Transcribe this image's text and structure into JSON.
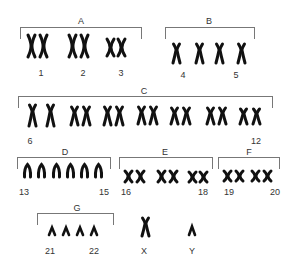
{
  "ink_color": "#111111",
  "bracket_color": "#777777",
  "label_color": "#333333",
  "groups": [
    {
      "name": "A",
      "label_x": 81,
      "label_y": 16,
      "bracket": {
        "x": 20,
        "y": 27,
        "w": 122,
        "h": 12
      },
      "chromosomes": [
        {
          "type": "meta",
          "x": 31,
          "y": 35,
          "h": 22
        },
        {
          "type": "meta",
          "x": 43,
          "y": 35,
          "h": 22
        },
        {
          "type": "meta",
          "x": 72,
          "y": 35,
          "h": 22
        },
        {
          "type": "meta",
          "x": 84,
          "y": 35,
          "h": 22
        },
        {
          "type": "meta-short",
          "x": 110,
          "y": 39,
          "h": 17
        },
        {
          "type": "meta-short",
          "x": 121,
          "y": 39,
          "h": 17
        }
      ],
      "numbers": [
        {
          "text": "1",
          "x": 41,
          "y": 68
        },
        {
          "text": "2",
          "x": 83,
          "y": 68
        },
        {
          "text": "3",
          "x": 121,
          "y": 68
        }
      ]
    },
    {
      "name": "B",
      "label_x": 209,
      "label_y": 16,
      "bracket": {
        "x": 165,
        "y": 27,
        "w": 90,
        "h": 12
      },
      "chromosomes": [
        {
          "type": "submeta",
          "x": 176,
          "y": 44,
          "h": 19
        },
        {
          "type": "submeta",
          "x": 199,
          "y": 44,
          "h": 19
        },
        {
          "type": "submeta",
          "x": 219,
          "y": 44,
          "h": 19
        },
        {
          "type": "submeta",
          "x": 241,
          "y": 44,
          "h": 19
        }
      ],
      "numbers": [
        {
          "text": "4",
          "x": 183,
          "y": 70
        },
        {
          "text": "5",
          "x": 236,
          "y": 70
        }
      ]
    },
    {
      "name": "C",
      "label_x": 144,
      "label_y": 86,
      "bracket": {
        "x": 18,
        "y": 96,
        "w": 255,
        "h": 12
      },
      "chromosomes": [
        {
          "type": "submeta",
          "x": 32,
          "y": 105,
          "h": 21
        },
        {
          "type": "submeta",
          "x": 50,
          "y": 105,
          "h": 21
        },
        {
          "type": "submeta",
          "x": 74,
          "y": 107,
          "h": 18
        },
        {
          "type": "submeta",
          "x": 86,
          "y": 107,
          "h": 18
        },
        {
          "type": "submeta",
          "x": 107,
          "y": 107,
          "h": 18
        },
        {
          "type": "submeta",
          "x": 119,
          "y": 107,
          "h": 18
        },
        {
          "type": "submeta",
          "x": 141,
          "y": 107,
          "h": 17
        },
        {
          "type": "submeta",
          "x": 153,
          "y": 107,
          "h": 17
        },
        {
          "type": "submeta",
          "x": 174,
          "y": 108,
          "h": 16
        },
        {
          "type": "submeta",
          "x": 186,
          "y": 108,
          "h": 16
        },
        {
          "type": "submeta",
          "x": 210,
          "y": 108,
          "h": 16
        },
        {
          "type": "submeta",
          "x": 222,
          "y": 108,
          "h": 16
        },
        {
          "type": "submeta",
          "x": 243,
          "y": 109,
          "h": 15
        },
        {
          "type": "submeta",
          "x": 256,
          "y": 109,
          "h": 15
        }
      ],
      "numbers": [
        {
          "text": "6",
          "x": 30,
          "y": 136
        },
        {
          "text": "12",
          "x": 256,
          "y": 136
        }
      ]
    },
    {
      "name": "D",
      "label_x": 65,
      "label_y": 147,
      "bracket": {
        "x": 17,
        "y": 157,
        "w": 94,
        "h": 12
      },
      "chromosomes": [
        {
          "type": "acro",
          "x": 27,
          "y": 164,
          "h": 13
        },
        {
          "type": "acro",
          "x": 41,
          "y": 164,
          "h": 13
        },
        {
          "type": "acro",
          "x": 56,
          "y": 164,
          "h": 13
        },
        {
          "type": "acro",
          "x": 70,
          "y": 164,
          "h": 13
        },
        {
          "type": "acro",
          "x": 84,
          "y": 164,
          "h": 13
        },
        {
          "type": "acro",
          "x": 98,
          "y": 164,
          "h": 13
        }
      ],
      "numbers": [
        {
          "text": "13",
          "x": 24,
          "y": 187
        },
        {
          "text": "15",
          "x": 104,
          "y": 187
        }
      ]
    },
    {
      "name": "E",
      "label_x": 165,
      "label_y": 147,
      "bracket": {
        "x": 119,
        "y": 157,
        "w": 94,
        "h": 12
      },
      "chromosomes": [
        {
          "type": "meta-small",
          "x": 128,
          "y": 171,
          "h": 11
        },
        {
          "type": "meta-small",
          "x": 140,
          "y": 171,
          "h": 11
        },
        {
          "type": "meta-small",
          "x": 161,
          "y": 171,
          "h": 11
        },
        {
          "type": "meta-small",
          "x": 173,
          "y": 171,
          "h": 11
        },
        {
          "type": "meta-small",
          "x": 192,
          "y": 172,
          "h": 10
        },
        {
          "type": "meta-small",
          "x": 203,
          "y": 172,
          "h": 10
        }
      ],
      "numbers": [
        {
          "text": "16",
          "x": 126,
          "y": 187
        },
        {
          "text": "18",
          "x": 203,
          "y": 187
        }
      ]
    },
    {
      "name": "F",
      "label_x": 249,
      "label_y": 147,
      "bracket": {
        "x": 218,
        "y": 157,
        "w": 62,
        "h": 12
      },
      "chromosomes": [
        {
          "type": "meta-small",
          "x": 227,
          "y": 171,
          "h": 10
        },
        {
          "type": "meta-small",
          "x": 239,
          "y": 171,
          "h": 10
        },
        {
          "type": "meta-small",
          "x": 255,
          "y": 171,
          "h": 10
        },
        {
          "type": "meta-small",
          "x": 267,
          "y": 171,
          "h": 10
        }
      ],
      "numbers": [
        {
          "text": "19",
          "x": 229,
          "y": 187
        },
        {
          "text": "20",
          "x": 275,
          "y": 187
        }
      ]
    },
    {
      "name": "G",
      "label_x": 77,
      "label_y": 203,
      "bracket": {
        "x": 37,
        "y": 213,
        "w": 77,
        "h": 12
      },
      "chromosomes": [
        {
          "type": "acro-small",
          "x": 52,
          "y": 227,
          "h": 8
        },
        {
          "type": "acro-small",
          "x": 66,
          "y": 227,
          "h": 8
        },
        {
          "type": "acro-small",
          "x": 80,
          "y": 227,
          "h": 8
        },
        {
          "type": "acro-small",
          "x": 94,
          "y": 227,
          "h": 8
        }
      ],
      "numbers": [
        {
          "text": "21",
          "x": 50,
          "y": 246
        },
        {
          "text": "22",
          "x": 94,
          "y": 246
        }
      ]
    }
  ],
  "sex_chromosomes": [
    {
      "name": "X",
      "type": "submeta",
      "x": 145,
      "y": 218,
      "h": 18,
      "label_x": 144,
      "label_y": 246
    },
    {
      "name": "Y",
      "type": "acro-small",
      "x": 192,
      "y": 226,
      "h": 9,
      "label_x": 192,
      "label_y": 246
    }
  ]
}
